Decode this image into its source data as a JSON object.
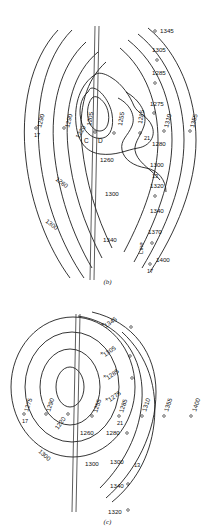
{
  "figure": {
    "type": "contour-map-pair",
    "panels": [
      {
        "id": "b",
        "caption": "(b)",
        "seismic_line_label": "Line",
        "center_markers": [
          {
            "name": "C",
            "label": "C"
          },
          {
            "name": "D",
            "label": "D"
          }
        ],
        "contour_labels": [
          "1345",
          "1305",
          "1285",
          "1275",
          "1310",
          "1355",
          "1290",
          "1290",
          "1205",
          "1255",
          "1285",
          "1220",
          "1260",
          "1280",
          "1300",
          "1320",
          "1340",
          "1370",
          "1400",
          "1260",
          "1300",
          "1300",
          "1340"
        ],
        "well_numbers": [
          "17",
          "21",
          "13",
          "17"
        ],
        "contour_values": [
          1205,
          1220,
          1255,
          1260,
          1275,
          1280,
          1285,
          1290,
          1300,
          1305,
          1310,
          1320,
          1340,
          1345,
          1355,
          1370,
          1400
        ]
      },
      {
        "id": "c",
        "caption": "(c)",
        "seismic_line_label": "",
        "contour_labels": [
          "1345",
          "1305",
          "1285",
          "1275",
          "1285",
          "1310",
          "1355",
          "1400",
          "1275",
          "1290",
          "1255",
          "1220",
          "1260",
          "1280",
          "1300",
          "1300",
          "1320",
          "1340",
          "1300"
        ],
        "well_numbers": [
          "17",
          "21",
          "13"
        ],
        "contour_values": [
          1220,
          1255,
          1260,
          1275,
          1280,
          1285,
          1290,
          1300,
          1305,
          1310,
          1320,
          1340,
          1345,
          1355,
          1400
        ]
      }
    ]
  },
  "colors": {
    "ink": "#111111",
    "paper": "#ffffff",
    "line_trace": "#333333"
  }
}
